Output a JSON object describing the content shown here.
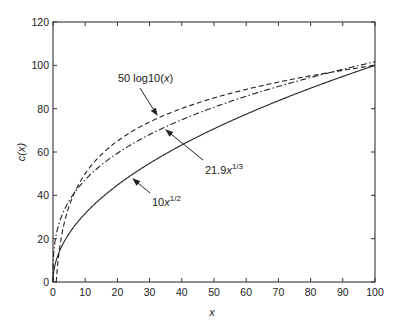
{
  "chart_data": {
    "type": "line",
    "title": "",
    "xlabel": "x",
    "ylabel": "c(x)",
    "xlim": [
      0,
      100
    ],
    "ylim": [
      0,
      120
    ],
    "grid": false,
    "legend": "none (inline arrow annotations)",
    "xticks": [
      0,
      10,
      20,
      30,
      40,
      50,
      60,
      70,
      80,
      90,
      100
    ],
    "yticks": [
      0,
      20,
      40,
      60,
      80,
      100,
      120
    ],
    "series": [
      {
        "name": "10 x^1/2",
        "style": "solid",
        "formula": "10*sqrt(x)",
        "x": [
          0,
          1,
          5,
          10,
          20,
          30,
          40,
          50,
          60,
          70,
          80,
          90,
          100
        ],
        "values": [
          0,
          10,
          22.4,
          31.6,
          44.7,
          54.8,
          63.2,
          70.7,
          77.5,
          83.7,
          89.4,
          94.9,
          100
        ]
      },
      {
        "name": "21.9 x^1/3",
        "style": "dashdot",
        "formula": "21.9*cbrt(x)",
        "x": [
          0,
          1,
          5,
          10,
          20,
          30,
          40,
          50,
          60,
          70,
          80,
          90,
          100
        ],
        "values": [
          0,
          21.9,
          37.4,
          47.2,
          59.4,
          68.0,
          74.9,
          80.7,
          85.7,
          90.2,
          94.3,
          98.1,
          101.6
        ]
      },
      {
        "name": "50 log10(x)",
        "style": "dashed",
        "formula": "50*log10(x)",
        "x": [
          1,
          2,
          5,
          10,
          20,
          30,
          40,
          50,
          60,
          70,
          80,
          90,
          100
        ],
        "values": [
          0,
          15.1,
          34.9,
          50,
          65.1,
          73.9,
          80.1,
          84.9,
          88.9,
          92.3,
          95.2,
          97.7,
          100
        ]
      }
    ],
    "annotations": [
      {
        "text_main": "50 log10(",
        "text_var": "x",
        "text_tail": ")",
        "label_pos": [
          118,
          82
        ],
        "arrow_from": [
          140,
          88
        ],
        "arrow_to": [
          157,
          115
        ]
      },
      {
        "text_main": "21.9",
        "text_var": "x",
        "text_sup": "1/3",
        "label_pos": [
          205,
          174
        ],
        "arrow_from": [
          203,
          160
        ],
        "arrow_to": [
          166,
          130
        ]
      },
      {
        "text_main": "10",
        "text_var": "x",
        "text_sup": "1/2",
        "label_pos": [
          152,
          206
        ],
        "arrow_from": [
          150,
          193
        ],
        "arrow_to": [
          133,
          179
        ]
      }
    ]
  }
}
